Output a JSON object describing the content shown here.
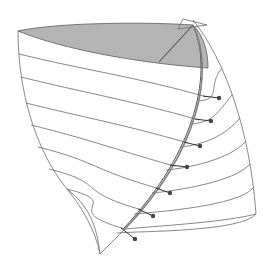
{
  "diagram": {
    "title": "",
    "kind": "3d-surface-wireframe",
    "colors": {
      "background": "#ffffff",
      "stroke": "#6a6a6a",
      "shade": "#b4b4b4",
      "dot": "#444444",
      "ridge": "#808080"
    },
    "top_cap": {
      "path": "M18,31 C60,22 150,22 193,25 C204,36 208,52 208,68 C150,64 70,52 18,31 Z"
    },
    "cap_diagonal": {
      "x1": 193,
      "y1": 25,
      "x2": 159,
      "y2": 62
    },
    "apex_triangle": {
      "points": "183,19 207,25 178,29"
    },
    "left_edge": "M18,31 C18,90 35,150 67,189 C80,205 95,228 100,254",
    "inner_left_edge": "M67,189 C88,205 97,225 100,254",
    "bottom_diagonal": "M100,254 L125,229",
    "right_envelope": "M193,20 C225,60 250,130 256,214",
    "bottom_right_curve": "M125,229 C170,225 225,222 256,214",
    "ridge_curve": "M193,25 C215,70 200,150 125,229",
    "ridge_inner": "M193,25 C213,70 198,150 123,229",
    "hoops": [
      {
        "left": [
          19,
          54
        ],
        "mid": [
          207,
          97
        ],
        "dot": [
          219,
          98
        ],
        "right_end": [
          222,
          68
        ]
      },
      {
        "left": [
          21,
          77
        ],
        "mid": [
          199,
          120
        ],
        "dot": [
          211,
          121
        ],
        "right_end": [
          232,
          95
        ]
      },
      {
        "left": [
          26,
          103
        ],
        "mid": [
          188,
          143
        ],
        "dot": [
          200,
          146
        ],
        "right_end": [
          240,
          118
        ]
      },
      {
        "left": [
          31,
          125
        ],
        "mid": [
          174,
          166
        ],
        "dot": [
          187,
          167
        ],
        "right_end": [
          246,
          141
        ]
      },
      {
        "left": [
          38,
          147
        ],
        "mid": [
          160,
          189
        ],
        "dot": [
          170,
          193
        ],
        "right_end": [
          250,
          164
        ]
      },
      {
        "left": [
          49,
          169
        ],
        "mid": [
          142,
          210
        ],
        "dot": [
          153,
          216
        ],
        "right_end": [
          253,
          188
        ]
      },
      {
        "left": [
          67,
          189
        ],
        "mid": [
          125,
          229
        ],
        "dot": [
          135,
          239
        ],
        "right_end": [
          256,
          214
        ]
      }
    ]
  }
}
